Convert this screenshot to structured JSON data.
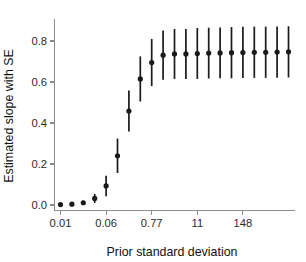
{
  "chart_data": {
    "type": "scatter",
    "title": "",
    "xlabel": "Prior standard deviation",
    "ylabel": "Estimated slope with SE",
    "xscale": "log",
    "grid": false,
    "legend": null,
    "point_color": "#1a1a1a",
    "errorbar_color": "#1a1a1a",
    "axis_color": "#8c8c8c",
    "ylim": [
      -0.04,
      0.9
    ],
    "yticks": [
      0.0,
      0.2,
      0.4,
      0.6,
      0.8
    ],
    "ytick_labels": [
      "0.0",
      "0.2",
      "0.4",
      "0.6",
      "0.8"
    ],
    "xticks_index": [
      0,
      4,
      8,
      12,
      16
    ],
    "xtick_labels": [
      "0.01",
      "0.06",
      "0.77",
      "11",
      "148"
    ],
    "x_index": [
      0,
      1,
      2,
      3,
      4,
      5,
      6,
      7,
      8,
      9,
      10,
      11,
      12,
      13,
      14,
      15,
      16,
      17,
      18,
      19,
      20
    ],
    "values": [
      0.002,
      0.004,
      0.011,
      0.032,
      0.093,
      0.24,
      0.458,
      0.615,
      0.695,
      0.731,
      0.737,
      0.737,
      0.739,
      0.741,
      0.742,
      0.743,
      0.744,
      0.745,
      0.745,
      0.746,
      0.747
    ],
    "errors": [
      0.004,
      0.006,
      0.01,
      0.022,
      0.05,
      0.084,
      0.1,
      0.11,
      0.115,
      0.12,
      0.122,
      0.122,
      0.124,
      0.124,
      0.124,
      0.125,
      0.125,
      0.125,
      0.125,
      0.125,
      0.125
    ]
  },
  "axes": {
    "x_title": "Prior standard deviation",
    "y_title": "Estimated slope with SE"
  }
}
